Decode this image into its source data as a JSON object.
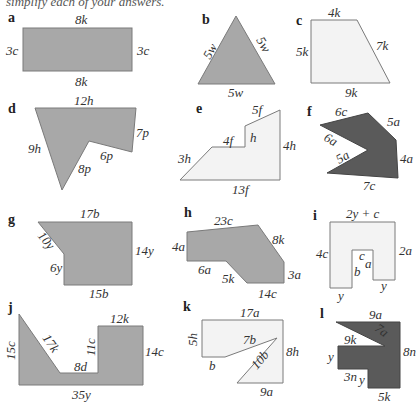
{
  "header": {
    "instruction_partial": "simplify each of your answers."
  },
  "colors": {
    "dark_fill": "#5a5a5a",
    "mid_fill": "#a8a8a8",
    "light_fill": "#f3f3f3",
    "stroke": "#7a7a7a"
  },
  "shapes": {
    "a": {
      "tag": "a",
      "fill": "mid",
      "labels": {
        "top": "8k",
        "left": "3c",
        "right": "3c",
        "bottom": "8k"
      }
    },
    "b": {
      "tag": "b",
      "fill": "mid",
      "labels": {
        "left": "5w",
        "right": "5w",
        "bottom": "5w"
      }
    },
    "c": {
      "tag": "c",
      "fill": "light",
      "labels": {
        "top": "4k",
        "left": "5k",
        "slant": "7k",
        "bottom": "9k"
      }
    },
    "d": {
      "tag": "d",
      "fill": "mid",
      "labels": {
        "top": "12h",
        "left": "9h",
        "right": "7p",
        "inner_upper": "6p",
        "inner_lower": "8p"
      }
    },
    "e": {
      "tag": "e",
      "fill": "light",
      "labels": {
        "top": "5f",
        "step_top": "4f",
        "step_side": "h",
        "slant": "3h",
        "right": "4h",
        "bottom": "13f"
      }
    },
    "f": {
      "tag": "f",
      "fill": "dark",
      "labels": {
        "top": "6c",
        "right_slant": "5a",
        "inner_upper": "6a",
        "inner_lower": "5a",
        "right": "4a",
        "bottom": "7c"
      }
    },
    "g": {
      "tag": "g",
      "fill": "mid",
      "labels": {
        "top": "17b",
        "slant": "10y",
        "left": "6y",
        "right": "14y",
        "bottom": "15b"
      }
    },
    "h": {
      "tag": "h",
      "fill": "mid",
      "labels": {
        "top": "23c",
        "right_slant": "8k",
        "left": "4a",
        "lower_left": "6a",
        "lower_slant": "5k",
        "right": "3a",
        "bottom": "14c"
      }
    },
    "i": {
      "tag": "i",
      "fill": "light",
      "labels": {
        "top": "2y + c",
        "left": "4c",
        "right": "2a",
        "notch_top": "c",
        "notch_left": "b",
        "notch_right": "a",
        "bottom_left": "y",
        "bottom_right": "y"
      }
    },
    "j": {
      "tag": "j",
      "fill": "mid",
      "labels": {
        "left": "15c",
        "slant": "17k",
        "middle": "8d",
        "step": "11c",
        "top": "12k",
        "right": "14c",
        "bottom": "35y"
      }
    },
    "k": {
      "tag": "k",
      "fill": "light",
      "labels": {
        "top": "17a",
        "left": "5h",
        "lower_left": "b",
        "inner_upper": "7b",
        "inner_lower": "10b",
        "right": "8h",
        "bottom": "9a"
      }
    },
    "l": {
      "tag": "l",
      "fill": "dark",
      "labels": {
        "top": "9a",
        "slant": "7a",
        "inner_top": "9k",
        "left": "y",
        "inner_bottom": "3n",
        "inner_side": "y",
        "right": "8n",
        "bottom": "5k"
      }
    }
  }
}
